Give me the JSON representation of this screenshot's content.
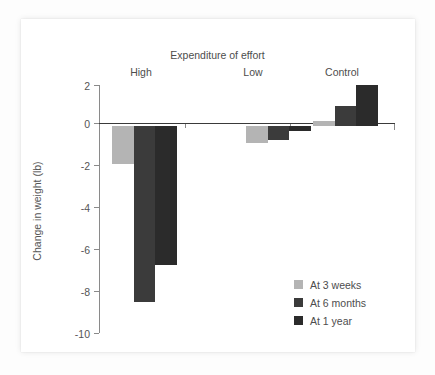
{
  "chart_data": {
    "type": "bar",
    "title": "Expenditure of effort",
    "xlabel": "",
    "ylabel": "Change in weight (lb)",
    "categories": [
      "High",
      "Low",
      "Control"
    ],
    "series": [
      {
        "name": "At 3 weeks",
        "color": "#b4b4b4",
        "values": [
          -1.8,
          -0.8,
          0.25
        ]
      },
      {
        "name": "At 6 months",
        "color": "#3b3b3b",
        "values": [
          -8.5,
          -0.65,
          1.0
        ]
      },
      {
        "name": "At 1 year",
        "color": "#2b2b2b",
        "values": [
          -6.7,
          -0.25,
          2.0
        ]
      }
    ],
    "ylim": [
      -10,
      2
    ],
    "yticks": [
      2,
      0,
      -2,
      -4,
      -6,
      -8,
      -10
    ],
    "ytick_labels": [
      "2",
      "0",
      "-2",
      "-4",
      "-6",
      "-8",
      "-10"
    ],
    "grid": false,
    "legend_position": "lower right",
    "baseline": 0
  },
  "colors": {
    "series_3_weeks": "#b4b4b4",
    "series_6_months": "#3b3b3b",
    "series_1_year": "#2b2b2b",
    "axis": "#8a8a8a",
    "baseline": "#3a3a3a",
    "text": "#4d4d4d",
    "card_background": "#ffffff",
    "page_background": "#fdfdfd"
  }
}
